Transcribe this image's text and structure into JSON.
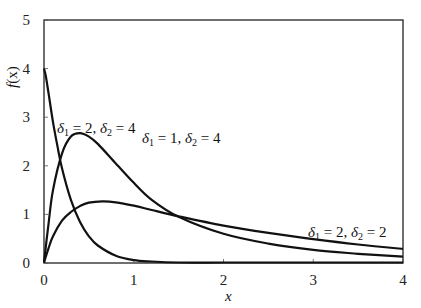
{
  "chart_data": {
    "type": "line",
    "title": "",
    "xlabel": "x",
    "ylabel": "f(x)",
    "xlim": [
      0,
      4
    ],
    "ylim": [
      0,
      5
    ],
    "x_ticks": [
      "0",
      "1",
      "2",
      "3",
      "4"
    ],
    "y_ticks": [
      "0",
      "1",
      "2",
      "3",
      "4",
      "5"
    ],
    "grid": false,
    "legend": "inline annotations",
    "series": [
      {
        "name": "δ1 = 2, δ2 = 4",
        "label_parts": {
          "d1": "2",
          "d2": "4"
        },
        "x": [
          0,
          0.02,
          0.05,
          0.1,
          0.15,
          0.2,
          0.3,
          0.4,
          0.5,
          0.6,
          0.8,
          1.0,
          1.2,
          1.5,
          2.0,
          2.5,
          3.0,
          4.0
        ],
        "y": [
          4.0,
          3.85,
          3.5,
          2.9,
          2.4,
          1.95,
          1.3,
          0.85,
          0.55,
          0.36,
          0.15,
          0.06,
          0.03,
          0.01,
          0.0,
          0.0,
          0.0,
          0.0
        ]
      },
      {
        "name": "δ1 = 1, δ2 = 4",
        "label_parts": {
          "d1": "1",
          "d2": "4"
        },
        "x": [
          0,
          0.05,
          0.1,
          0.2,
          0.3,
          0.4,
          0.5,
          0.6,
          0.8,
          1.0,
          1.2,
          1.5,
          2.0,
          2.5,
          3.0,
          3.5,
          4.0
        ],
        "y": [
          0.0,
          0.8,
          1.5,
          2.25,
          2.6,
          2.67,
          2.6,
          2.45,
          2.05,
          1.65,
          1.3,
          0.95,
          0.6,
          0.4,
          0.27,
          0.19,
          0.13
        ]
      },
      {
        "name": "δ1 = 2, δ2 = 2",
        "label_parts": {
          "d1": "2",
          "d2": "2"
        },
        "x": [
          0,
          0.05,
          0.1,
          0.2,
          0.3,
          0.4,
          0.5,
          0.65,
          0.8,
          1.0,
          1.2,
          1.5,
          2.0,
          2.5,
          3.0,
          3.5,
          4.0
        ],
        "y": [
          0.0,
          0.3,
          0.55,
          0.87,
          1.05,
          1.17,
          1.24,
          1.27,
          1.25,
          1.18,
          1.09,
          0.96,
          0.77,
          0.62,
          0.49,
          0.38,
          0.29
        ]
      }
    ],
    "annotations": [
      {
        "series": 0,
        "text": "δ1 = 2, δ2 = 4",
        "x": 0.15,
        "y": 3.45
      },
      {
        "series": 1,
        "text": "δ1 = 1, δ2 = 4",
        "x": 1.08,
        "y": 2.45
      },
      {
        "series": 2,
        "text": "δ1 = 2, δ2 = 2",
        "x": 2.72,
        "y": 0.35
      }
    ]
  },
  "axes": {
    "x_label": "x",
    "y_label": "f(x)",
    "y_label_func": "f",
    "y_label_arg": "(x)"
  },
  "annotations_text": {
    "a0": {
      "delta": "δ",
      "s1": "1",
      "v1": " = 2, ",
      "s2": "2",
      "v2": " = 4"
    },
    "a1": {
      "delta": "δ",
      "s1": "1",
      "v1": " = 1, ",
      "s2": "2",
      "v2": " = 4"
    },
    "a2": {
      "delta": "δ",
      "s1": "1",
      "v1": " = 2, ",
      "s2": "2",
      "v2": " = 2"
    }
  }
}
